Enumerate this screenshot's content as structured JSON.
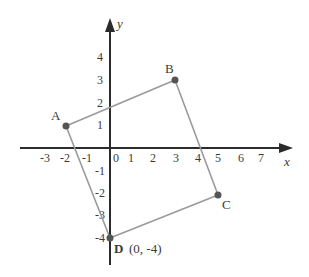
{
  "diagram": {
    "type": "coordinate-plane-quadrilateral",
    "axes": {
      "x_label": "x",
      "y_label": "y",
      "x_ticks": [
        "-3",
        "-2",
        "-1",
        "0",
        "1",
        "2",
        "3",
        "4",
        "5",
        "6",
        "7"
      ],
      "y_ticks_positive": [
        "1",
        "2",
        "3",
        "4"
      ],
      "y_ticks_negative": [
        "-1",
        "-2",
        "-3",
        "-4"
      ],
      "x_range": [
        -3,
        7
      ],
      "y_range": [
        -4,
        4
      ]
    },
    "points": [
      {
        "name": "A",
        "label": "A",
        "x": -2,
        "y": 1
      },
      {
        "name": "B",
        "label": "B",
        "x": 3,
        "y": 3
      },
      {
        "name": "C",
        "label": "C",
        "x": 5,
        "y": -2
      },
      {
        "name": "D",
        "label": "D",
        "x": 0,
        "y": -4,
        "coord_label": "(0, -4)"
      }
    ],
    "polygon_order": [
      "A",
      "B",
      "C",
      "D"
    ],
    "colors": {
      "axis": "#2b2b2b",
      "edge": "#9a9a9a",
      "vertex": "#555555",
      "text": "#3a3a3a"
    }
  }
}
